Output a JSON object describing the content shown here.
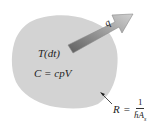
{
  "diagram": {
    "body": {
      "fill": "#d3d3d3"
    },
    "arrow": {
      "label": "q",
      "gradient_start": "#6e6e6e",
      "gradient_end": "#c8c8c8"
    },
    "labels": {
      "temperature": "T(dt)",
      "capacitance": "C = cpV"
    },
    "resistance": {
      "symbol": "R",
      "equals": "=",
      "numerator": "1",
      "denominator_h": "h̄A",
      "denominator_sub": "s"
    }
  }
}
